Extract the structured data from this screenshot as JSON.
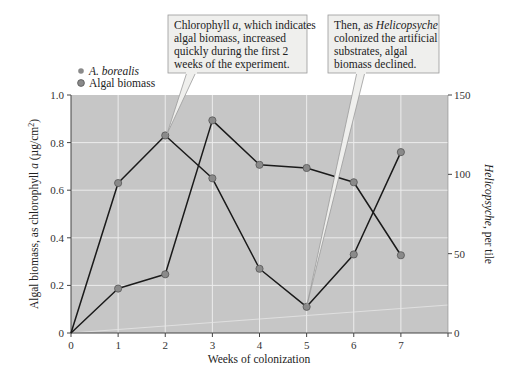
{
  "chart_data": {
    "type": "line",
    "title": "",
    "x": [
      0,
      1,
      2,
      3,
      4,
      5,
      6,
      7
    ],
    "xlabel": "Weeks of colonization",
    "ylabel": "Algal biomass, as chlorophyll a (µg/cm²)",
    "ylabel_parts": [
      "Algal biomass, as chlorophyll ",
      "a",
      " (µg/cm",
      "2",
      ")"
    ],
    "y2label": "Helicopsyche, per tile",
    "y2label_parts": [
      "Helicopsyche",
      ", per tile"
    ],
    "xlim": [
      0,
      8
    ],
    "ylim": [
      0,
      1.0
    ],
    "y2lim": [
      0,
      150
    ],
    "xticks": [
      "0",
      "1",
      "2",
      "3",
      "4",
      "5",
      "6",
      "7"
    ],
    "yticks": [
      "0",
      "0.2",
      "0.4",
      "0.6",
      "0.8",
      "1.0"
    ],
    "y2ticks": [
      "0",
      "50",
      "100",
      "150"
    ],
    "grid": true,
    "legend_position": "top-left",
    "series": [
      {
        "name": "A. borealis",
        "axis": "right",
        "values": [
          0,
          28,
          37,
          134,
          106,
          104,
          95,
          49
        ]
      },
      {
        "name": "Algal biomass",
        "axis": "left",
        "values": [
          0,
          0.63,
          0.83,
          0.65,
          0.27,
          0.11,
          0.33,
          0.76
        ]
      }
    ],
    "annotations": [
      {
        "text_lines": [
          "Chlorophyll a, which indicates",
          "algal biomass, increased",
          "quickly during the first 2",
          "weeks of the experiment."
        ],
        "points_to": {
          "series": "Algal biomass",
          "x": 2
        }
      },
      {
        "text_lines": [
          "Then, as Helicopsyche",
          "colonized the artificial",
          "substrates, algal",
          "biomass declined."
        ],
        "points_to": {
          "series": "Algal biomass",
          "x": 5
        }
      }
    ]
  },
  "legend": {
    "items": [
      {
        "label": "A. borealis",
        "italic": true
      },
      {
        "label": "Algal biomass",
        "italic": false
      }
    ]
  },
  "callouts": {
    "first": {
      "line1_a": "Chlorophyll ",
      "line1_b": "a",
      "line1_c": ", which indicates",
      "line2": "algal biomass, increased",
      "line3": "quickly during the first 2",
      "line4": "weeks of the experiment."
    },
    "second": {
      "line1_a": "Then, as ",
      "line1_b": "Helicopsyche",
      "line2": "colonized the artificial",
      "line3": "substrates, algal",
      "line4": "biomass declined."
    }
  },
  "colors": {
    "plot_bg": "#c6c6c6",
    "grid": "#ececec",
    "line": "#1a1a1a",
    "marker_fill": "#8a8a8a",
    "marker_stroke": "#555555",
    "callout_fill": "#efefed",
    "callout_stroke": "#9a9a9a"
  }
}
